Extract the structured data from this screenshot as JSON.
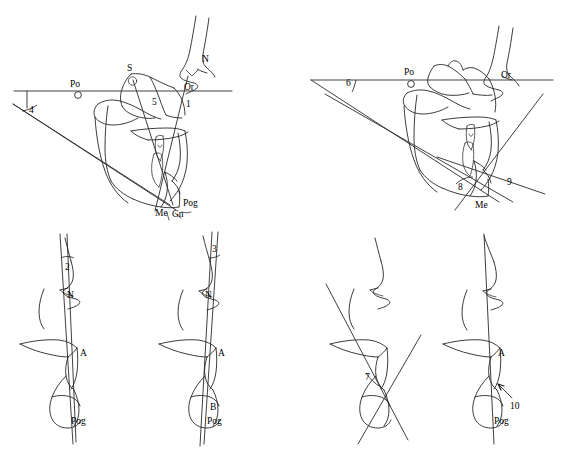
{
  "figure": {
    "background_color": "#ffffff",
    "ink_color": "#1a1a1a",
    "panel_count": 6
  },
  "panels": [
    {
      "id": "panel-1",
      "position": "top-left",
      "measure_number": "4",
      "landmarks": [
        "Po",
        "S",
        "N",
        "Or",
        "Pog",
        "Me",
        "Gn"
      ],
      "inline_numbers": [
        "5",
        "1"
      ],
      "labels": {
        "po": "Po",
        "s": "S",
        "n": "N",
        "or": "Or",
        "pog": "Pog",
        "me": "Me",
        "gn": "Gn",
        "angle": "4",
        "five": "5",
        "one": "1"
      }
    },
    {
      "id": "panel-2",
      "position": "top-right",
      "measure_number": "6",
      "landmarks": [
        "Po",
        "Or",
        "Me"
      ],
      "inline_numbers": [
        "8",
        "9"
      ],
      "labels": {
        "po": "Po",
        "or": "Or",
        "me": "Me",
        "angle": "6",
        "eight": "8",
        "nine": "9"
      }
    },
    {
      "id": "panel-3",
      "position": "bottom-1",
      "measure_number": "2",
      "landmarks": [
        "N",
        "A",
        "Pog"
      ],
      "labels": {
        "n": "N",
        "a": "A",
        "pog": "Pog",
        "angle": "2"
      }
    },
    {
      "id": "panel-4",
      "position": "bottom-2",
      "measure_number": "3",
      "landmarks": [
        "N",
        "A",
        "B",
        "Pog"
      ],
      "labels": {
        "n": "N",
        "a": "A",
        "b": "B",
        "pog": "Pog",
        "angle": "3"
      }
    },
    {
      "id": "panel-5",
      "position": "bottom-3",
      "measure_number": "7",
      "landmarks": [],
      "labels": {
        "angle": "7"
      }
    },
    {
      "id": "panel-6",
      "position": "bottom-4",
      "measure_number": "10",
      "landmarks": [
        "A",
        "Pog"
      ],
      "labels": {
        "a": "A",
        "pog": "Pog",
        "angle": "10"
      }
    }
  ]
}
